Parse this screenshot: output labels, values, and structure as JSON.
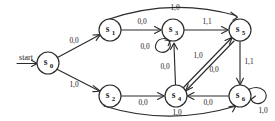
{
  "diagram": {
    "kind": "finite-state-machine",
    "title": "",
    "start_marker": {
      "label": "start",
      "target": "S0"
    },
    "nodes": [
      {
        "id": "S0",
        "base": "s",
        "subscript": "0",
        "label": "s0",
        "cx": 48,
        "cy": 63,
        "r": 11
      },
      {
        "id": "S1",
        "base": "s",
        "subscript": "1",
        "label": "s1",
        "cx": 110,
        "cy": 30,
        "r": 11
      },
      {
        "id": "S2",
        "base": "s",
        "subscript": "2",
        "label": "s2",
        "cx": 110,
        "cy": 96,
        "r": 11
      },
      {
        "id": "S3",
        "base": "s",
        "subscript": "3",
        "label": "s3",
        "cx": 173,
        "cy": 30,
        "r": 11
      },
      {
        "id": "S4",
        "base": "s",
        "subscript": "4",
        "label": "s4",
        "cx": 176,
        "cy": 96,
        "r": 11
      },
      {
        "id": "S5",
        "base": "s",
        "subscript": "5",
        "label": "s5",
        "cx": 240,
        "cy": 30,
        "r": 11
      },
      {
        "id": "S6",
        "base": "s",
        "subscript": "6",
        "label": "s6",
        "cx": 240,
        "cy": 96,
        "r": 11
      }
    ],
    "edges": [
      {
        "id": "e-s0-s1",
        "from": "S0",
        "to": "S1",
        "label": "0,0",
        "label_x": 74,
        "label_y": 41
      },
      {
        "id": "e-s0-s2",
        "from": "S0",
        "to": "S2",
        "label": "1,0",
        "label_x": 74,
        "label_y": 85
      },
      {
        "id": "e-s1-s3",
        "from": "S1",
        "to": "S3",
        "label": "0,0",
        "label_x": 142,
        "label_y": 23
      },
      {
        "id": "e-s1-s5",
        "from": "S1",
        "to": "S5",
        "label": "1,0",
        "label_x": 175,
        "label_y": 8
      },
      {
        "id": "e-s3-s3",
        "from": "S3",
        "to": "S3",
        "label": "0,0",
        "label_x": 145,
        "label_y": 47,
        "self_loop": true
      },
      {
        "id": "e-s3-s5",
        "from": "S3",
        "to": "S5",
        "label": "1,1",
        "label_x": 207,
        "label_y": 23
      },
      {
        "id": "e-s2-s4",
        "from": "S2",
        "to": "S4",
        "label": "0,0",
        "label_x": 143,
        "label_y": 102
      },
      {
        "id": "e-s2-s6",
        "from": "S2",
        "to": "S6",
        "label": "1,0",
        "label_x": 177,
        "label_y": 114
      },
      {
        "id": "e-s4-s3",
        "from": "S4",
        "to": "S3",
        "label": "0,0",
        "label_x": 165,
        "label_y": 67
      },
      {
        "id": "e-s4-s5",
        "from": "S4",
        "to": "S5",
        "label": "1,0",
        "label_x": 198,
        "label_y": 56
      },
      {
        "id": "e-s5-s4",
        "from": "S5",
        "to": "S4",
        "label": "0,0",
        "label_x": 213,
        "label_y": 70
      },
      {
        "id": "e-s5-s6",
        "from": "S5",
        "to": "S6",
        "label": "1,1",
        "label_x": 248,
        "label_y": 62
      },
      {
        "id": "e-s6-s4",
        "from": "S6",
        "to": "S4",
        "label": "0,0",
        "label_x": 208,
        "label_y": 102
      },
      {
        "id": "e-s6-s6",
        "from": "S6",
        "to": "S6",
        "label": "1,0",
        "label_x": 262,
        "label_y": 110,
        "self_loop": true
      }
    ],
    "colors": {
      "stroke": "#2b2b2b",
      "node_fill": "#ffffff",
      "text": "#1a1a1a",
      "background": "#ffffff"
    }
  }
}
